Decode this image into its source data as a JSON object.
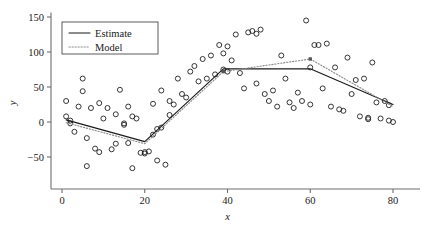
{
  "chart_data": {
    "type": "scatter",
    "title": "",
    "xlabel": "x",
    "ylabel": "y",
    "xlim": [
      -2,
      84
    ],
    "ylim": [
      -75,
      155
    ],
    "xticks": [
      0,
      20,
      40,
      60,
      80
    ],
    "yticks": [
      -50,
      0,
      50,
      100,
      150
    ],
    "xtick_labels": [
      "0",
      "20",
      "40",
      "60",
      "80"
    ],
    "ytick_labels": [
      "−50",
      "0",
      "50",
      "100",
      "150"
    ],
    "grid": false,
    "legend": {
      "position": "top-left",
      "entries": [
        {
          "label": "Estimate",
          "style": "solid",
          "color": "#1a1a1a"
        },
        {
          "label": "Model",
          "style": "dotted",
          "color": "#8c8c8c"
        }
      ]
    },
    "scatter": {
      "marker": "open-circle",
      "color": "#1f1f1f",
      "points": [
        [
          1,
          8
        ],
        [
          1,
          30
        ],
        [
          2,
          2
        ],
        [
          2,
          -2
        ],
        [
          3,
          -14
        ],
        [
          4,
          22
        ],
        [
          5,
          44
        ],
        [
          5,
          62
        ],
        [
          6,
          -23
        ],
        [
          6,
          -63
        ],
        [
          7,
          20
        ],
        [
          8,
          -38
        ],
        [
          9,
          27
        ],
        [
          9,
          -43
        ],
        [
          10,
          5
        ],
        [
          11,
          20
        ],
        [
          12,
          -39
        ],
        [
          13,
          11
        ],
        [
          13,
          -31
        ],
        [
          14,
          46
        ],
        [
          15,
          -2
        ],
        [
          15,
          -4
        ],
        [
          16,
          22
        ],
        [
          16,
          -30
        ],
        [
          17,
          8
        ],
        [
          17,
          -66
        ],
        [
          18,
          5
        ],
        [
          19,
          -44
        ],
        [
          20,
          -45
        ],
        [
          20,
          -43
        ],
        [
          21,
          -42
        ],
        [
          22,
          -18
        ],
        [
          22,
          26
        ],
        [
          23,
          -10
        ],
        [
          23,
          -55
        ],
        [
          24,
          -8
        ],
        [
          24,
          45
        ],
        [
          25,
          -61
        ],
        [
          26,
          10
        ],
        [
          26,
          30
        ],
        [
          27,
          25
        ],
        [
          28,
          62
        ],
        [
          29,
          40
        ],
        [
          30,
          35
        ],
        [
          31,
          72
        ],
        [
          32,
          80
        ],
        [
          33,
          58
        ],
        [
          34,
          90
        ],
        [
          35,
          62
        ],
        [
          36,
          95
        ],
        [
          37,
          68
        ],
        [
          38,
          110
        ],
        [
          39,
          98
        ],
        [
          39,
          75
        ],
        [
          40,
          72
        ],
        [
          40,
          108
        ],
        [
          41,
          88
        ],
        [
          42,
          125
        ],
        [
          43,
          70
        ],
        [
          44,
          48
        ],
        [
          45,
          128
        ],
        [
          46,
          130
        ],
        [
          47,
          126
        ],
        [
          47,
          55
        ],
        [
          48,
          132
        ],
        [
          49,
          40
        ],
        [
          50,
          30
        ],
        [
          51,
          45
        ],
        [
          52,
          22
        ],
        [
          53,
          95
        ],
        [
          54,
          62
        ],
        [
          55,
          28
        ],
        [
          56,
          20
        ],
        [
          57,
          42
        ],
        [
          58,
          30
        ],
        [
          59,
          145
        ],
        [
          60,
          78
        ],
        [
          60,
          25
        ],
        [
          61,
          110
        ],
        [
          62,
          110
        ],
        [
          63,
          48
        ],
        [
          64,
          112
        ],
        [
          65,
          22
        ],
        [
          66,
          78
        ],
        [
          67,
          18
        ],
        [
          68,
          16
        ],
        [
          69,
          92
        ],
        [
          70,
          40
        ],
        [
          71,
          60
        ],
        [
          72,
          8
        ],
        [
          73,
          62
        ],
        [
          74,
          6
        ],
        [
          74,
          4
        ],
        [
          75,
          85
        ],
        [
          76,
          28
        ],
        [
          77,
          5
        ],
        [
          78,
          30
        ],
        [
          79,
          2
        ],
        [
          79,
          24
        ],
        [
          80,
          0
        ]
      ]
    },
    "series": [
      {
        "name": "Estimate",
        "style": "solid",
        "color": "#1a1a1a",
        "knots": [
          [
            1,
            3
          ],
          [
            20,
            -28
          ],
          [
            39,
            76
          ],
          [
            60,
            76
          ],
          [
            80,
            25
          ]
        ]
      },
      {
        "name": "Model",
        "style": "dotted",
        "color": "#8c8c8c",
        "knots": [
          [
            1,
            -1
          ],
          [
            20,
            -31
          ],
          [
            39,
            72
          ],
          [
            60,
            90
          ],
          [
            80,
            22
          ]
        ]
      }
    ]
  }
}
